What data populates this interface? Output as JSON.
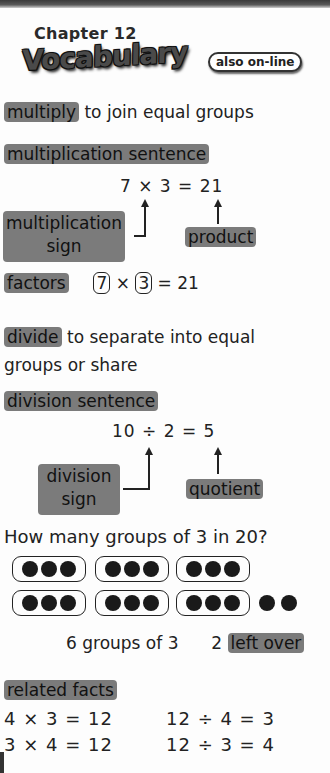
{
  "header": {
    "chapter": "Chapter 12",
    "title": "Vocabulary",
    "online_badge": "also on-line"
  },
  "multiply": {
    "term": "multiply",
    "definition": "to join equal groups"
  },
  "multiplication_sentence": {
    "term": "multiplication sentence",
    "equation": "7 × 3 = 21",
    "sign_label_line1": "multiplication",
    "sign_label_line2": "sign",
    "product_label": "product"
  },
  "factors": {
    "term": "factors",
    "factor1": "7",
    "times": "×",
    "factor2": "3",
    "result": "= 21"
  },
  "divide": {
    "term": "divide",
    "definition_line1": "to separate into equal",
    "definition_line2": "groups or share"
  },
  "division_sentence": {
    "term": "division sentence",
    "equation": "10 ÷ 2 = 5",
    "sign_label_line1": "division",
    "sign_label_line2": "sign",
    "quotient_label": "quotient"
  },
  "grouping": {
    "question": "How many groups of 3 in 20?",
    "groups": 6,
    "group_size": 3,
    "leftover_dots": 2,
    "summary": "6 groups of 3",
    "leftover_count": "2",
    "leftover_term": "left over"
  },
  "related_facts": {
    "term": "related facts",
    "facts": [
      "4 × 3 = 12",
      "12 ÷ 4 = 3",
      "3 × 4 = 12",
      "12 ÷ 3 = 4"
    ]
  },
  "colors": {
    "highlight": "#7b7b7b",
    "text": "#222222",
    "background": "#fdfdfd"
  }
}
